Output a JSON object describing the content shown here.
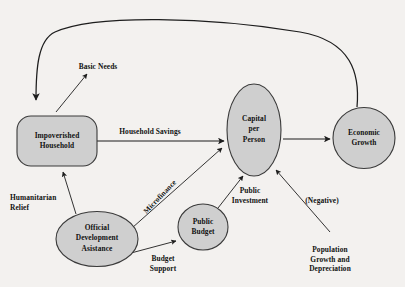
{
  "diagram": {
    "background_color": "#f3f1ef",
    "node_fill": "#cfcfcf",
    "node_stroke": "#3a3a3a",
    "text_color": "#111111",
    "nodes": [
      {
        "id": "impoverished_household",
        "shape": "rounded-rect",
        "lines": [
          "Impoverished",
          "Household"
        ],
        "cx": 57,
        "cy": 141,
        "w": 80,
        "h": 50
      },
      {
        "id": "official_development_asistance",
        "shape": "ellipse",
        "lines": [
          "Official",
          "Development",
          "Asistance"
        ],
        "cx": 97,
        "cy": 239,
        "w": 82,
        "h": 55
      },
      {
        "id": "public_budget",
        "shape": "circle",
        "lines": [
          "Public",
          "Budget"
        ],
        "cx": 203,
        "cy": 227,
        "w": 50,
        "h": 46
      },
      {
        "id": "capital_per_person",
        "shape": "ellipse",
        "lines": [
          "Capital",
          "per",
          "Person"
        ],
        "cx": 254,
        "cy": 130,
        "w": 54,
        "h": 92
      },
      {
        "id": "economic_growth",
        "shape": "circle",
        "lines": [
          "Economic",
          "Growth"
        ],
        "cx": 364,
        "cy": 138,
        "w": 62,
        "h": 61
      }
    ],
    "edge_labels": [
      {
        "id": "basic_needs",
        "text": "Basic Needs",
        "x": 98,
        "y": 62,
        "align": "center",
        "rotate": 0
      },
      {
        "id": "household_savings",
        "text": "Household Savings",
        "x": 150,
        "y": 127,
        "align": "center",
        "rotate": 0
      },
      {
        "id": "humanitarian_relief",
        "lines": [
          "Humanitarian",
          "Relief"
        ],
        "x": 10,
        "y": 193,
        "align": "left",
        "rotate": 0
      },
      {
        "id": "microfinance",
        "text": "Microfinance",
        "x": 160,
        "y": 192,
        "align": "center",
        "rotate": -46
      },
      {
        "id": "budget_support",
        "lines": [
          "Budget",
          "Support"
        ],
        "x": 163,
        "y": 254,
        "align": "center",
        "rotate": 0
      },
      {
        "id": "public_investment",
        "lines": [
          "Public",
          "Investment"
        ],
        "x": 250,
        "y": 186,
        "align": "center",
        "rotate": 0
      },
      {
        "id": "negative",
        "text": "(Negative)",
        "x": 322,
        "y": 196,
        "align": "center",
        "rotate": 0
      },
      {
        "id": "population_growth_and_depreciation",
        "lines": [
          "Population",
          "Growth and",
          "Depreciation"
        ],
        "x": 330,
        "y": 245,
        "align": "center",
        "rotate": 0
      }
    ],
    "edges": [
      {
        "id": "economic-growth-to-impoverished-household",
        "label": "",
        "kind": "curve"
      },
      {
        "id": "impoverished-household-to-basic-needs",
        "label": "Basic Needs",
        "kind": "straight"
      },
      {
        "id": "impoverished-household-to-capital-per-person",
        "label": "Household Savings",
        "kind": "straight"
      },
      {
        "id": "capital-per-person-to-economic-growth",
        "label": "",
        "kind": "straight"
      },
      {
        "id": "official-development-asistance-to-impoverished-household",
        "label": "Humanitarian Relief",
        "kind": "straight"
      },
      {
        "id": "official-development-asistance-to-capital-per-person",
        "label": "Microfinance",
        "kind": "straight"
      },
      {
        "id": "official-development-asistance-to-public-budget",
        "label": "Budget Support",
        "kind": "straight"
      },
      {
        "id": "public-budget-to-capital-per-person",
        "label": "Public Investment",
        "kind": "straight"
      },
      {
        "id": "population-growth-to-capital-per-person",
        "label": "(Negative)",
        "kind": "straight"
      }
    ]
  }
}
